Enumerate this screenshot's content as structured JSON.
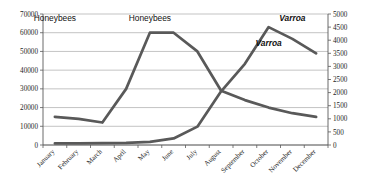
{
  "chart_data": {
    "type": "line",
    "title": "",
    "xlabel": "",
    "categories": [
      "January",
      "February",
      "March",
      "April",
      "May",
      "June",
      "July",
      "August",
      "September",
      "October",
      "November",
      "December"
    ],
    "grid": true,
    "legend_position": "inline-annotations",
    "series": [
      {
        "name": "Honeybees",
        "axis": "left",
        "values": [
          15000,
          14000,
          12000,
          30000,
          60000,
          60000,
          50000,
          29000,
          24000,
          20000,
          17000,
          15000
        ]
      },
      {
        "name": "Varroa",
        "axis": "right",
        "values": [
          60,
          60,
          70,
          80,
          120,
          250,
          700,
          2050,
          3100,
          4500,
          4050,
          3500
        ]
      }
    ],
    "axes": {
      "left": {
        "label": "",
        "ylim": [
          0,
          70000
        ],
        "step": 10000,
        "ticks": [
          "0",
          "10000",
          "20000",
          "30000",
          "40000",
          "50000",
          "60000",
          "70000"
        ]
      },
      "right": {
        "label": "",
        "ylim": [
          0,
          5000
        ],
        "step": 500,
        "ticks": [
          "0",
          "500",
          "1000",
          "1500",
          "2000",
          "2500",
          "3000",
          "3500",
          "4000",
          "4500",
          "5000"
        ]
      }
    },
    "annotations": [
      {
        "text": "Honeybees",
        "style": "upright",
        "x_month": "January",
        "value_left": 66000
      },
      {
        "text": "Honeybees",
        "style": "upright",
        "x_month": "May",
        "value_left": 66000
      },
      {
        "text": "Varroa",
        "style": "italic",
        "x_month": "November",
        "value_left": 66000
      },
      {
        "text": "Varroa",
        "style": "italic",
        "x_month": "October",
        "value_left": 53000
      }
    ],
    "colors": {
      "series_line": "#595959",
      "gridline": "#9a9a9a",
      "axis": "#5a5a5a",
      "text": "#1d1d1d",
      "background": "#ffffff"
    }
  }
}
